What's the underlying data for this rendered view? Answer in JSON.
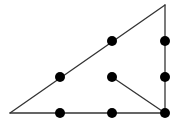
{
  "diagram": {
    "title": "",
    "width": 179,
    "height": 129,
    "colors": {
      "background": "#ffffff",
      "line": "#333333",
      "dot": "#000000"
    },
    "line_width": 1.3,
    "dot_radius": 5,
    "lines": [
      {
        "id": "hypotenuse",
        "x1": 10,
        "y1": 113,
        "x2": 165,
        "y2": 5
      },
      {
        "id": "right-side",
        "x1": 165,
        "y1": 5,
        "x2": 165,
        "y2": 113
      },
      {
        "id": "bottom-side",
        "x1": 10,
        "y1": 113,
        "x2": 165,
        "y2": 113
      },
      {
        "id": "inner-segment",
        "x1": 112,
        "y1": 77,
        "x2": 165,
        "y2": 113
      }
    ],
    "dots": [
      {
        "id": "dot-1",
        "cx": 112,
        "cy": 41
      },
      {
        "id": "dot-2",
        "cx": 165,
        "cy": 41
      },
      {
        "id": "dot-3",
        "cx": 60,
        "cy": 77
      },
      {
        "id": "dot-4",
        "cx": 112,
        "cy": 77
      },
      {
        "id": "dot-5",
        "cx": 165,
        "cy": 77
      },
      {
        "id": "dot-6",
        "cx": 60,
        "cy": 113
      },
      {
        "id": "dot-7",
        "cx": 112,
        "cy": 113
      },
      {
        "id": "dot-8",
        "cx": 165,
        "cy": 113
      }
    ]
  }
}
